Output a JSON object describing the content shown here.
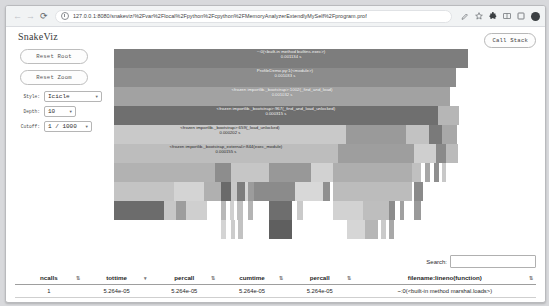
{
  "browser": {
    "back_icon": "arrow-left-icon",
    "forward_icon": "arrow-right-icon",
    "reload_icon": "reload-icon",
    "url": "127.0.0.1:8080/snakeviz/%2Fvar%2Flocal%2Fpython%2Fcpython%2FMemoryAnalyzerExtendlyMySelf%2Fprogram.prof",
    "icons": [
      "edit-bookmark-icon",
      "star-icon",
      "extensions-icon",
      "split-screen-icon",
      "browser-square-icon",
      "profile-avatar-icon"
    ]
  },
  "app": {
    "title": "SnakeViz",
    "call_stack_label": "Call Stack",
    "reset_root_label": "Reset Root",
    "reset_zoom_label": "Reset Zoom",
    "controls": [
      {
        "label": "Style:",
        "value": "Icicle"
      },
      {
        "label": "Depth:",
        "value": "10"
      },
      {
        "label": "Cutoff:",
        "value": "1 / 1000"
      }
    ]
  },
  "chart_data": {
    "type": "icicle",
    "blocks": [
      {
        "label": "~:0(<built-in method builtins.exec>)",
        "time": "0.001134 s",
        "x": 0,
        "y": 0,
        "w": 84.3,
        "h": 9.4,
        "color": "#7d7d7d",
        "textDark": false
      },
      {
        "label": "ProfileDemo.py:1(<module>)",
        "time": "0.001033 s",
        "x": 0,
        "y": 9.4,
        "w": 81.4,
        "h": 9.4,
        "color": "#8c8c8c",
        "textDark": false
      },
      {
        "label": "<frozen importlib._bootstrap>:1002(_find_and_load)",
        "time": "0.001032 s",
        "x": 0,
        "y": 18.8,
        "w": 80.0,
        "h": 9.4,
        "color": "#a2a2a2",
        "textDark": false
      },
      {
        "label": "<frozen importlib._bootstrap>:967(_find_and_load_unlocked)",
        "time": "0.000315 s",
        "x": 0,
        "y": 28.2,
        "w": 77.1,
        "h": 9.4,
        "color": "#6f6f6f",
        "textDark": false
      },
      {
        "label": "<frozen importlib._bootstrap>:659(_load_unlocked)",
        "time": "0.000202 s",
        "x": 0,
        "y": 37.6,
        "w": 55.2,
        "h": 9.4,
        "color": "#c9c9c9",
        "textDark": true
      },
      {
        "label": "<frozen importlib._bootstrap_external>:844(exec_module)",
        "time": "0.000155 s",
        "x": 0,
        "y": 47.0,
        "w": 53.3,
        "h": 9.4,
        "color": "#bdbdbd",
        "textDark": true
      }
    ],
    "tiles": [
      {
        "x": 77.1,
        "y": 28.2,
        "w": 5.0,
        "h": 9.4,
        "color": "#b6b6b6"
      },
      {
        "x": 55.2,
        "y": 37.6,
        "w": 14.3,
        "h": 9.4,
        "color": "#9a9a9a"
      },
      {
        "x": 69.5,
        "y": 37.6,
        "w": 5.5,
        "h": 9.4,
        "color": "#c2c2c2"
      },
      {
        "x": 75.0,
        "y": 37.6,
        "w": 3.1,
        "h": 9.4,
        "color": "#7a7a7a"
      },
      {
        "x": 78.1,
        "y": 37.6,
        "w": 3.6,
        "h": 9.4,
        "color": "#a8a8a8"
      },
      {
        "x": 53.3,
        "y": 47.0,
        "w": 18.1,
        "h": 9.4,
        "color": "#9e9e9e"
      },
      {
        "x": 71.4,
        "y": 47.0,
        "w": 5.2,
        "h": 9.4,
        "color": "#cfcfcf"
      },
      {
        "x": 76.6,
        "y": 47.0,
        "w": 2.4,
        "h": 9.4,
        "color": "#8a8a8a"
      },
      {
        "x": 79.0,
        "y": 47.0,
        "w": 2.9,
        "h": 9.4,
        "color": "#bbbbbb"
      },
      {
        "x": 0,
        "y": 56.4,
        "w": 24.0,
        "h": 9.4,
        "color": "#b2b2b2"
      },
      {
        "x": 24.0,
        "y": 56.4,
        "w": 3.8,
        "h": 9.4,
        "color": "#8d8d8d"
      },
      {
        "x": 27.8,
        "y": 56.4,
        "w": 9.0,
        "h": 9.4,
        "color": "#c6c6c6"
      },
      {
        "x": 36.8,
        "y": 56.4,
        "w": 10.2,
        "h": 9.4,
        "color": "#989898"
      },
      {
        "x": 47.0,
        "y": 56.4,
        "w": 5.2,
        "h": 9.4,
        "color": "#d2d2d2"
      },
      {
        "x": 52.2,
        "y": 56.4,
        "w": 18.8,
        "h": 9.4,
        "color": "#aeaeae"
      },
      {
        "x": 71.0,
        "y": 56.4,
        "w": 2.2,
        "h": 9.4,
        "color": "#c0c0c0"
      },
      {
        "x": 74.0,
        "y": 56.4,
        "w": 1.2,
        "h": 9.4,
        "color": "#a6a6a6"
      },
      {
        "x": 76.2,
        "y": 56.4,
        "w": 1.2,
        "h": 9.4,
        "color": "#8f8f8f"
      },
      {
        "x": 78.1,
        "y": 56.4,
        "w": 1.0,
        "h": 9.4,
        "color": "#c8c8c8"
      },
      {
        "x": 0,
        "y": 65.8,
        "w": 14.3,
        "h": 9.4,
        "color": "#c4c4c4"
      },
      {
        "x": 14.3,
        "y": 65.8,
        "w": 7.1,
        "h": 9.4,
        "color": "#d4d4d4"
      },
      {
        "x": 21.4,
        "y": 65.8,
        "w": 4.0,
        "h": 9.4,
        "color": "#b0b0b0"
      },
      {
        "x": 25.4,
        "y": 65.8,
        "w": 2.4,
        "h": 9.4,
        "color": "#6a6a6a"
      },
      {
        "x": 27.8,
        "y": 65.8,
        "w": 1.4,
        "h": 9.4,
        "color": "#c8c8c8"
      },
      {
        "x": 29.2,
        "y": 65.8,
        "w": 1.9,
        "h": 9.4,
        "color": "#7d7d7d"
      },
      {
        "x": 31.1,
        "y": 65.8,
        "w": 0.9,
        "h": 9.4,
        "color": "#d6d6d6"
      },
      {
        "x": 32.0,
        "y": 65.8,
        "w": 1.4,
        "h": 9.4,
        "color": "#9c9c9c"
      },
      {
        "x": 33.4,
        "y": 65.8,
        "w": 9.8,
        "h": 9.4,
        "color": "#8b8b8b"
      },
      {
        "x": 43.2,
        "y": 65.8,
        "w": 6.5,
        "h": 9.4,
        "color": "#d8d8d8"
      },
      {
        "x": 49.7,
        "y": 65.8,
        "w": 1.7,
        "h": 9.4,
        "color": "#909090"
      },
      {
        "x": 52.2,
        "y": 65.8,
        "w": 18.8,
        "h": 9.4,
        "color": "#bcbcbc"
      },
      {
        "x": 71.5,
        "y": 65.8,
        "w": 2.1,
        "h": 9.4,
        "color": "#8a8a8a"
      },
      {
        "x": 0,
        "y": 75.2,
        "w": 11.9,
        "h": 9.4,
        "color": "#6c6c6c"
      },
      {
        "x": 11.9,
        "y": 75.2,
        "w": 2.9,
        "h": 9.4,
        "color": "#c7c7c7"
      },
      {
        "x": 14.8,
        "y": 75.2,
        "w": 2.4,
        "h": 9.4,
        "color": "#9d9d9d"
      },
      {
        "x": 17.2,
        "y": 75.2,
        "w": 5.0,
        "h": 9.4,
        "color": "#cfcfcf"
      },
      {
        "x": 25.4,
        "y": 75.2,
        "w": 1.2,
        "h": 9.4,
        "color": "#b8b8b8"
      },
      {
        "x": 27.6,
        "y": 75.2,
        "w": 1.0,
        "h": 9.4,
        "color": "#d0d0d0"
      },
      {
        "x": 29.4,
        "y": 75.2,
        "w": 1.4,
        "h": 9.4,
        "color": "#c0c0c0"
      },
      {
        "x": 32.0,
        "y": 75.2,
        "w": 1.2,
        "h": 9.4,
        "color": "#b4b4b4"
      },
      {
        "x": 36.8,
        "y": 75.2,
        "w": 5.5,
        "h": 9.4,
        "color": "#6e6e6e"
      },
      {
        "x": 43.5,
        "y": 75.2,
        "w": 1.5,
        "h": 9.4,
        "color": "#cacaca"
      },
      {
        "x": 52.2,
        "y": 75.2,
        "w": 7.0,
        "h": 9.4,
        "color": "#d2d2d2"
      },
      {
        "x": 59.2,
        "y": 75.2,
        "w": 6.2,
        "h": 9.4,
        "color": "#bebebe"
      },
      {
        "x": 65.4,
        "y": 75.2,
        "w": 1.4,
        "h": 9.4,
        "color": "#8c8c8c"
      },
      {
        "x": 68.0,
        "y": 75.2,
        "w": 1.0,
        "h": 9.4,
        "color": "#a0a0a0"
      },
      {
        "x": 71.5,
        "y": 75.2,
        "w": 1.6,
        "h": 9.4,
        "color": "#9a9a9a"
      },
      {
        "x": 25.4,
        "y": 84.6,
        "w": 1.2,
        "h": 9.4,
        "color": "#d4d4d4"
      },
      {
        "x": 27.8,
        "y": 84.6,
        "w": 1.0,
        "h": 9.4,
        "color": "#cccccc"
      },
      {
        "x": 29.6,
        "y": 84.6,
        "w": 1.2,
        "h": 9.4,
        "color": "#c2c2c2"
      },
      {
        "x": 36.8,
        "y": 84.6,
        "w": 5.5,
        "h": 9.4,
        "color": "#5f5f5f"
      },
      {
        "x": 55.5,
        "y": 84.6,
        "w": 4.2,
        "h": 9.4,
        "color": "#d6d6d6"
      },
      {
        "x": 59.7,
        "y": 84.6,
        "w": 3.2,
        "h": 9.4,
        "color": "#b6b6b6"
      },
      {
        "x": 63.6,
        "y": 84.6,
        "w": 1.2,
        "h": 9.4,
        "color": "#cacaca"
      },
      {
        "x": 65.4,
        "y": 84.6,
        "w": 1.2,
        "h": 9.4,
        "color": "#a8a8a8"
      }
    ]
  },
  "table": {
    "search_label": "Search:",
    "search_value": "",
    "search_placeholder": "",
    "columns": [
      {
        "label": "ncalls",
        "sort": "⇅"
      },
      {
        "label": "tottime",
        "sort": "▾"
      },
      {
        "label": "percall",
        "sort": "⇅"
      },
      {
        "label": "cumtime",
        "sort": "⇅"
      },
      {
        "label": "percall",
        "sort": "⇅"
      },
      {
        "label": "filename:lineno(function)",
        "sort": "⇅"
      }
    ],
    "rows": [
      {
        "ncalls": "1",
        "tottime": "5.264e-05",
        "percall1": "5.264e-05",
        "cumtime": "5.264e-05",
        "percall2": "5.264e-05",
        "fn": "~:0(<built-in method marshal.loads>)"
      }
    ]
  }
}
